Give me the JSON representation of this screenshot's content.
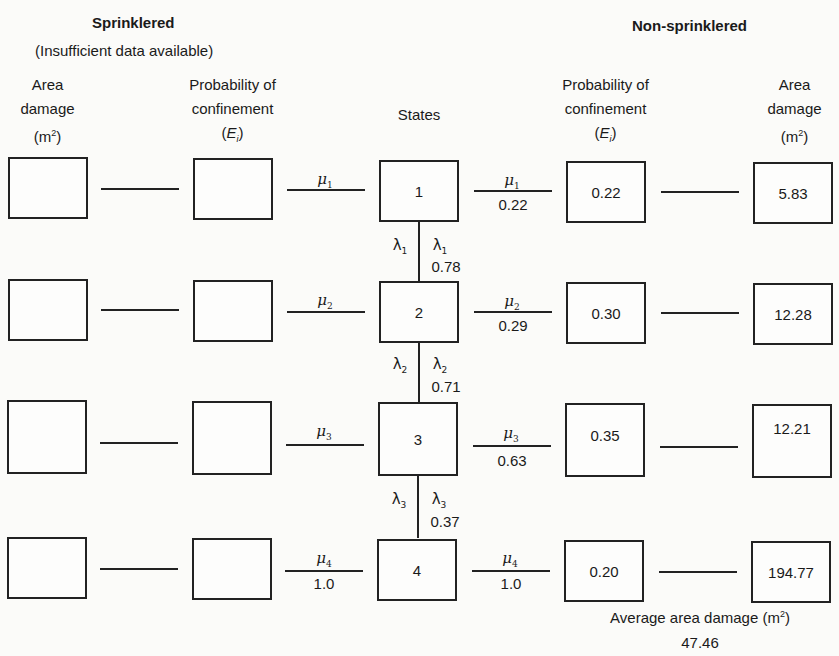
{
  "headings": {
    "sprinklered": "Sprinklered",
    "sprinklered_note": "(Insufficient data available)",
    "non_sprinklered": "Non-sprinklered"
  },
  "columns": {
    "sprinklered_area": {
      "line1": "Area",
      "line2": "damage",
      "line3": "(m²)"
    },
    "sprinklered_prob": {
      "line1": "Probability of",
      "line2": "confinement",
      "line3": "(Eᵢ)"
    },
    "states": {
      "line1": "States"
    },
    "nonspr_prob": {
      "line1": "Probability of",
      "line2": "confinement",
      "line3": "(Eᵢ)"
    },
    "nonspr_area": {
      "line1": "Area",
      "line2": "damage",
      "line3": "(m²)"
    }
  },
  "states": [
    {
      "id": "1",
      "mu_left": "μ1",
      "mu_left_value": "",
      "mu_right": "μ1",
      "mu_right_value": "0.22",
      "lambda": "λ1",
      "lambda_value": "0.78",
      "nonspr_prob": "0.22",
      "nonspr_area": "5.83"
    },
    {
      "id": "2",
      "mu_left": "μ2",
      "mu_left_value": "",
      "mu_right": "μ2",
      "mu_right_value": "0.29",
      "lambda": "λ2",
      "lambda_value": "0.71",
      "nonspr_prob": "0.30",
      "nonspr_area": "12.28"
    },
    {
      "id": "3",
      "mu_left": "μ3",
      "mu_left_value": "",
      "mu_right": "μ3",
      "mu_right_value": "0.63",
      "lambda": "λ3",
      "lambda_value": "0.37",
      "nonspr_prob": "0.35",
      "nonspr_area": "12.21"
    },
    {
      "id": "4",
      "mu_left": "μ4",
      "mu_left_value": "1.0",
      "mu_right": "μ4",
      "mu_right_value": "1.0",
      "lambda": "",
      "lambda_value": "",
      "nonspr_prob": "0.20",
      "nonspr_area": "194.77"
    }
  ],
  "summary": {
    "label": "Average area damage (m²)",
    "value": "47.46"
  }
}
